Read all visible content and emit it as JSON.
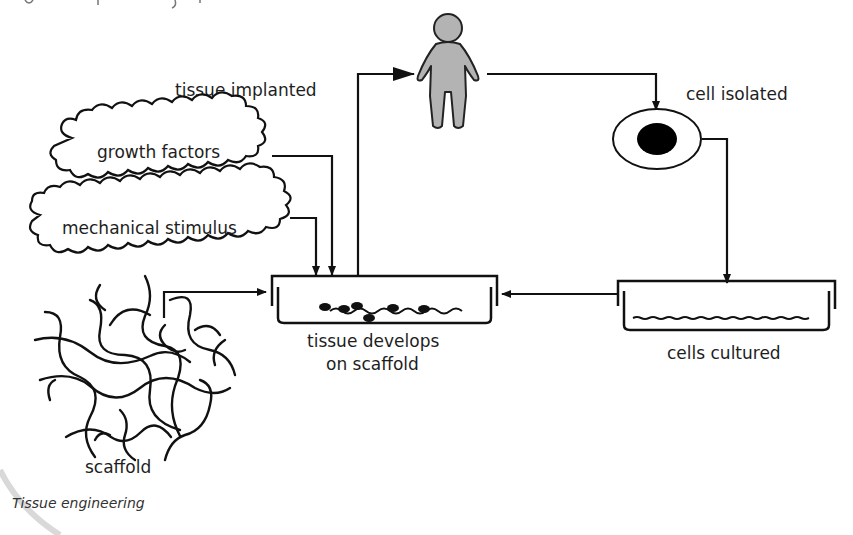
{
  "figure": {
    "caption": "Tissue engineering",
    "colors": {
      "stroke": "#111111",
      "person_fill": "#b3b3b3",
      "nucleus_fill": "#000000",
      "background": "#ffffff"
    }
  },
  "nodes": {
    "person": {
      "icon": "person-icon"
    },
    "cell": {
      "label": "cell isolated",
      "icon": "cell-icon"
    },
    "culture_dish": {
      "label": "cells cultured",
      "icon": "petri-dish-icon"
    },
    "tissue_dish": {
      "label_line1": "tissue develops",
      "label_line2": "on scaffold",
      "icon": "petri-dish-icon"
    },
    "growth_factors": {
      "label": "growth factors",
      "icon": "cloud-icon"
    },
    "mechanical_stimulus": {
      "label": "mechanical stimulus",
      "icon": "cloud-icon"
    },
    "scaffold": {
      "label": "scaffold",
      "icon": "scaffold-mesh-icon"
    }
  },
  "edges": [
    {
      "from": "person",
      "to": "cell",
      "label": ""
    },
    {
      "from": "cell",
      "to": "culture_dish",
      "label": ""
    },
    {
      "from": "culture_dish",
      "to": "tissue_dish",
      "label": ""
    },
    {
      "from": "growth_factors",
      "to": "tissue_dish",
      "label": ""
    },
    {
      "from": "mechanical_stimulus",
      "to": "tissue_dish",
      "label": ""
    },
    {
      "from": "scaffold",
      "to": "tissue_dish",
      "label": ""
    },
    {
      "from": "tissue_dish",
      "to": "person",
      "label": "tissue implanted"
    }
  ],
  "edge_labels": {
    "tissue_implanted": "tissue implanted"
  }
}
